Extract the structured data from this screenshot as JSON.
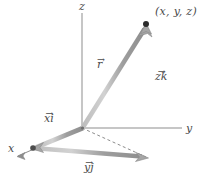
{
  "figure": {
    "kind": "3d-vector-decomposition-diagram",
    "background": "#ffffff",
    "stroke_color": "#9a9a9a",
    "stroke_highlight": "#c9c9c9",
    "axis_color": "#8d8d8d",
    "dash_color": "#7f7f7f",
    "label_color": "#4a4a4a",
    "point_color": "#2b2b2b",
    "width": 206,
    "height": 182
  },
  "axes": [
    {
      "id": "z",
      "label": "z",
      "label_x": 79,
      "label_y": 2,
      "from": [
        82,
        128
      ],
      "to": [
        82,
        13
      ]
    },
    {
      "id": "y",
      "label": "y",
      "label_x": 186,
      "label_y": 124,
      "from": [
        82,
        128
      ],
      "to": [
        182,
        128
      ]
    },
    {
      "id": "x",
      "label": "x",
      "label_x": 8,
      "label_y": 144,
      "from": [
        82,
        128
      ],
      "to": [
        18,
        156
      ]
    }
  ],
  "vectors": [
    {
      "id": "r",
      "label": "r",
      "accent": "vector-arrow",
      "label_x": 97,
      "label_y": 60,
      "from": [
        82,
        128
      ],
      "to": [
        146,
        25
      ],
      "description": "position vector from origin to the point"
    },
    {
      "id": "zk",
      "label": "zk",
      "accent": "vector-arrow",
      "label_x": 155,
      "label_y": 72,
      "from": [
        146,
        157
      ],
      "to": [
        146,
        25
      ],
      "description": "vertical z-component"
    },
    {
      "id": "xi",
      "label": "xi",
      "accent": "vector-arrow",
      "label_x": 44,
      "label_y": 114,
      "from": [
        82,
        128
      ],
      "to": [
        33,
        148
      ],
      "description": "x-component along the x axis"
    },
    {
      "id": "yj",
      "label": "yj",
      "accent": "vector-arrow",
      "label_x": 84,
      "label_y": 163,
      "from": [
        33,
        148
      ],
      "to": [
        146,
        157
      ],
      "description": "y-component parallel to the y axis"
    }
  ],
  "dashed": {
    "id": "projection-line",
    "from": [
      82,
      128
    ],
    "to": [
      146,
      157
    ],
    "description": "dashed projection of r onto the xy plane"
  },
  "points": [
    {
      "id": "tip",
      "label": "(x, y, z)",
      "label_x": 155,
      "label_y": 7,
      "x": 146,
      "y": 25
    },
    {
      "id": "corner",
      "label": "",
      "x": 33,
      "y": 148
    }
  ]
}
